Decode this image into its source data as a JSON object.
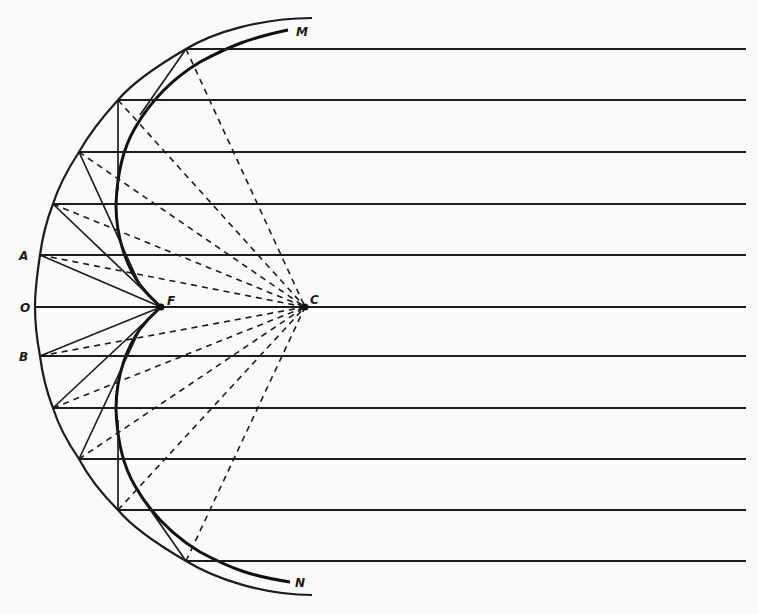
{
  "figure": {
    "type": "optical-diagram",
    "labels": {
      "M": "M",
      "N": "N",
      "A": "A",
      "O": "O",
      "B": "B",
      "F": "F",
      "C": "C"
    },
    "points": {
      "C": [
        305,
        307
      ],
      "F": [
        161,
        307
      ],
      "O": [
        35,
        307
      ],
      "A": [
        40,
        255
      ],
      "B": [
        40,
        356
      ]
    },
    "ray_heights_y": [
      49,
      100,
      152,
      204,
      255,
      307,
      356,
      408,
      459,
      510,
      561
    ],
    "mirror_hit_x": [
      186,
      118,
      79,
      53,
      40,
      35,
      40,
      53,
      79,
      118,
      186
    ],
    "ray_end_x": 746,
    "colors": {
      "background": "#fafaf8",
      "ink": "#1c1c1c"
    }
  }
}
